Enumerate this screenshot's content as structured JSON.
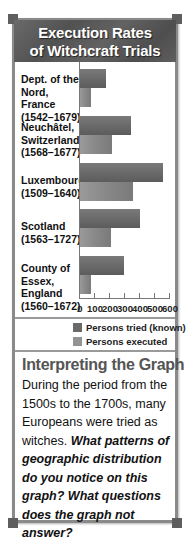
{
  "title": {
    "line1": "Execution Rates",
    "line2": "of Witchcraft Trials"
  },
  "chart_data": {
    "type": "bar",
    "orientation": "horizontal",
    "title": "Execution Rates of Witchcraft Trials",
    "categories": [
      "Dept. of the Nord, France (1542–1679)",
      "Neuchâtel, Switzerland (1568–1677)",
      "Luxembourg (1509–1640)",
      "Scotland (1563–1727)",
      "County of Essex, England (1560–1672)"
    ],
    "category_lines": [
      [
        "Dept. of the",
        "Nord, France",
        "(1542–1679)"
      ],
      [
        "Neuchâtel,",
        "Switzerland",
        "(1568–1677)"
      ],
      [
        "Luxembourg",
        "(1509–1640)"
      ],
      [
        "Scotland",
        "(1563–1727)"
      ],
      [
        "County of",
        "Essex,",
        "England",
        "(1560–1672)"
      ]
    ],
    "series": [
      {
        "name": "Persons tried (known)",
        "color": "#6a6a6a",
        "values": [
          170,
          340,
          555,
          400,
          290
        ]
      },
      {
        "name": "Persons executed",
        "color": "#939393",
        "values": [
          75,
          210,
          355,
          205,
          70
        ]
      }
    ],
    "xlabel": "",
    "ylabel": "",
    "xlim": [
      0,
      600
    ],
    "xticks": [
      0,
      100,
      200,
      300,
      400,
      500,
      600
    ],
    "grid": false,
    "legend_position": "bottom-right"
  },
  "legend": {
    "tried": "Persons tried (known)",
    "executed": "Persons executed"
  },
  "ticks": [
    "0",
    "100",
    "200",
    "300",
    "400",
    "500",
    "600"
  ],
  "interpreting": {
    "title": "Interpreting the Graph",
    "body": "During the period from the 1500s to the 1700s, many Europeans were tried as witches.",
    "question": "What patterns of geographic distribution do you notice on this graph? What questions does the graph not answer?"
  }
}
